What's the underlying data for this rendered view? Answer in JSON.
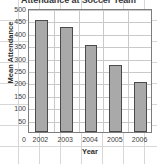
{
  "chart_data": {
    "type": "bar",
    "title": "Attendance at Soccer Team",
    "xlabel": "Year",
    "ylabel": "Mean Attendance",
    "categories": [
      "2002",
      "2003",
      "2004",
      "2005",
      "2006"
    ],
    "values": [
      450,
      425,
      350,
      270,
      200
    ],
    "ylim": [
      0,
      500
    ],
    "ytick_labels": [
      "500",
      "450",
      "400",
      "350",
      "300",
      "250",
      "200",
      "150",
      "100",
      "50"
    ],
    "ytick_values": [
      500,
      450,
      400,
      350,
      300,
      250,
      200,
      150,
      100,
      50
    ],
    "zero_label": "0",
    "grid": true,
    "legend": "none",
    "bar_fill_color": "#a9a9a9",
    "bar_border_color": "#4a4a4a",
    "grid_color": "#c9c9c9",
    "paper_grid_color": "#d7d7d7",
    "axis_color": "#7d7d7d",
    "text_color": "#3d3d3d"
  }
}
